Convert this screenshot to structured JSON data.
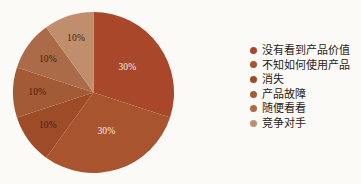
{
  "background_color": "#fbfaf7",
  "chart_data": {
    "type": "pie",
    "title": "",
    "subtitle": "",
    "xlabel": "",
    "ylabel": "",
    "legend_position": "right",
    "grid": false,
    "start_angle_deg": 0,
    "direction": "clockwise",
    "labels_inside": true,
    "total": 100,
    "unit": "%",
    "categories": [
      "没有看到产品价值",
      "不知如何使用产品",
      "消失",
      "产品故障",
      "随便看看",
      "竞争对手"
    ],
    "values": [
      30,
      30,
      10,
      10,
      10,
      10
    ],
    "value_labels": [
      "30%",
      "30%",
      "10%",
      "10%",
      "10%",
      "10%"
    ],
    "colors": [
      "#A8472A",
      "#A8542F",
      "#9E4C28",
      "#A35B36",
      "#AB6A48",
      "#C08E6C"
    ],
    "slices": [
      {
        "category": "没有看到产品价值",
        "value": 30,
        "label": "30%",
        "color": "#A8472A",
        "label_color": "light",
        "start_deg": 0,
        "end_deg": 108
      },
      {
        "category": "不知如何使用产品",
        "value": 30,
        "label": "30%",
        "color": "#A8542F",
        "label_color": "light",
        "start_deg": 108,
        "end_deg": 216
      },
      {
        "category": "消失",
        "value": 10,
        "label": "10%",
        "color": "#9E4C28",
        "label_color": "dark",
        "start_deg": 216,
        "end_deg": 252
      },
      {
        "category": "产品故障",
        "value": 10,
        "label": "10%",
        "color": "#A35B36",
        "label_color": "dark",
        "start_deg": 252,
        "end_deg": 288
      },
      {
        "category": "随便看看",
        "value": 10,
        "label": "10%",
        "color": "#AB6A48",
        "label_color": "dark",
        "start_deg": 288,
        "end_deg": 324
      },
      {
        "category": "竞争对手",
        "value": 10,
        "label": "10%",
        "color": "#C08E6C",
        "label_color": "dark",
        "start_deg": 324,
        "end_deg": 360
      }
    ]
  },
  "legend": {
    "items": [
      {
        "label": "没有看到产品价值",
        "color": "#A8472A"
      },
      {
        "label": "不知如何使用产品",
        "color": "#A8542F"
      },
      {
        "label": "消失",
        "color": "#9E4C28"
      },
      {
        "label": "产品故障",
        "color": "#A35B36"
      },
      {
        "label": "随便看看",
        "color": "#AB6A48"
      },
      {
        "label": "竞争对手",
        "color": "#C08E6C"
      }
    ]
  }
}
